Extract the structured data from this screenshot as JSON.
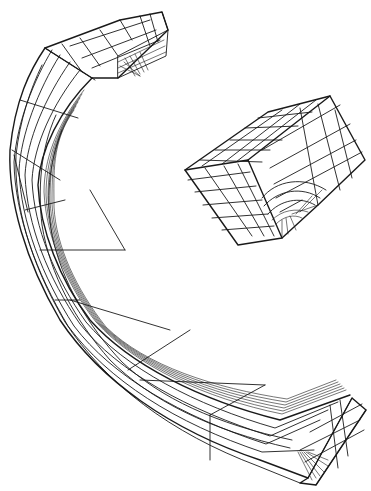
{
  "figure": {
    "type": "finite-element mesh line drawing",
    "background_color": "#ffffff",
    "line_color": "#1a1a1a",
    "objects": [
      {
        "id": "curved-beam-mesh",
        "description": "Curved (arc-shaped) rectangular beam meshed with hexahedral elements, refined toward the inner edge and at both end faces"
      },
      {
        "id": "cube-mesh",
        "description": "Cube block meshed with hexahedral elements, with a refined graded region around a corner/notch on the front face"
      }
    ]
  }
}
